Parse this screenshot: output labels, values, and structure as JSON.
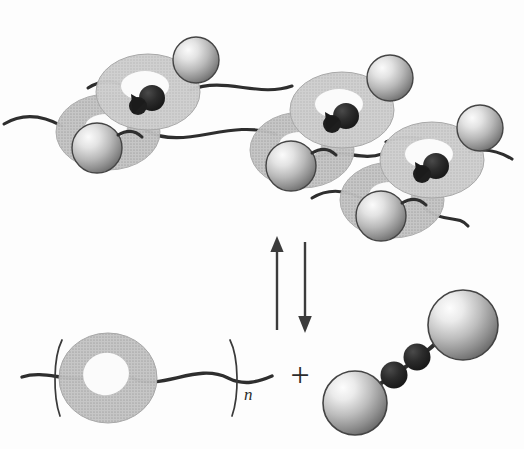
{
  "figure": {
    "background_color": "#fdfdfd",
    "width": 524,
    "height": 449
  },
  "palette": {
    "ring_fill": "#b9b9b9",
    "ring_fill_light": "#c6c6c6",
    "ring_shadow": "#9e9e9e",
    "cavity_fill": "#fbfbfb",
    "sphere_light": "#f2f2f2",
    "sphere_mid": "#b5b5b5",
    "sphere_dark": "#6f6f6f",
    "sphere_outline": "#3a3a3a",
    "guest_dark": "#262626",
    "chain_stroke": "#2e2e2e",
    "arrow_stroke": "#3c3c3c",
    "text_color": "#2b2b2b"
  },
  "top_assembly": {
    "label": "supramolecular polymer assembly",
    "unit_count": 3,
    "units": [
      {
        "name": "assembly-unit-1",
        "host_ring_front": {
          "cx": 148,
          "cy": 92,
          "rx": 52,
          "ry": 38,
          "rot": -18
        },
        "host_ring_back": {
          "cx": 108,
          "cy": 132,
          "rx": 52,
          "ry": 38,
          "rot": -18
        },
        "cap_sphere": {
          "cx": 196,
          "cy": 60,
          "r": 23
        },
        "end_sphere": {
          "cx": 97,
          "cy": 148,
          "r": 25
        },
        "guest": {
          "cx": 152,
          "cy": 98
        }
      },
      {
        "name": "assembly-unit-2",
        "host_ring_front": {
          "cx": 342,
          "cy": 110,
          "rx": 52,
          "ry": 38,
          "rot": -18
        },
        "host_ring_back": {
          "cx": 300,
          "cy": 150,
          "rx": 52,
          "ry": 38,
          "rot": -18
        },
        "cap_sphere": {
          "cx": 389,
          "cy": 78,
          "r": 23
        },
        "end_sphere": {
          "cx": 289,
          "cy": 167,
          "r": 25
        },
        "guest": {
          "cx": 346,
          "cy": 116
        }
      },
      {
        "name": "assembly-unit-3",
        "host_ring_front": {
          "cx": 432,
          "cy": 160,
          "rx": 52,
          "ry": 38,
          "rot": -18
        },
        "host_ring_back": {
          "cx": 390,
          "cy": 200,
          "rx": 52,
          "ry": 38,
          "rot": -18
        },
        "cap_sphere": {
          "cx": 478,
          "cy": 128,
          "r": 23
        },
        "end_sphere": {
          "cx": 379,
          "cy": 217,
          "r": 25
        },
        "guest": {
          "cx": 436,
          "cy": 166
        }
      }
    ],
    "connector_chains": 6
  },
  "equilibrium": {
    "label": "reversible equilibrium",
    "up_arrow": {
      "x": 277,
      "y_tail": 330,
      "y_head": 238,
      "direction": "up"
    },
    "down_arrow": {
      "x": 305,
      "y_tail": 242,
      "y_head": 331,
      "direction": "down"
    }
  },
  "bottom_left": {
    "label": "polymer-threaded host repeat unit",
    "bracket_open_x": 58,
    "bracket_close_x": 232,
    "subscript": "n",
    "subscript_x": 246,
    "subscript_y": 396,
    "host_ring": {
      "cx": 108,
      "cy": 378,
      "rx": 49,
      "ry": 45
    },
    "chain_y": 376
  },
  "plus_sign": {
    "label": "plus",
    "symbol": "+",
    "x": 300,
    "y": 385
  },
  "bottom_right": {
    "label": "ditopic guest molecule",
    "sphere_lower_left": {
      "cx": 355,
      "cy": 403,
      "r": 32
    },
    "sphere_upper_right": {
      "cx": 463,
      "cy": 325,
      "r": 35
    },
    "dark_bead_1": {
      "cx": 394,
      "cy": 375,
      "r": 13
    },
    "dark_bead_2": {
      "cx": 417,
      "cy": 358,
      "r": 13
    }
  },
  "legend_semantics": {
    "gray_torus": "macrocyclic host (cyclodextrin-like ring)",
    "light_sphere": "bulky stopper / terminal group",
    "dark_bead": "guest binding site",
    "wavy_line": "polymer chain"
  }
}
